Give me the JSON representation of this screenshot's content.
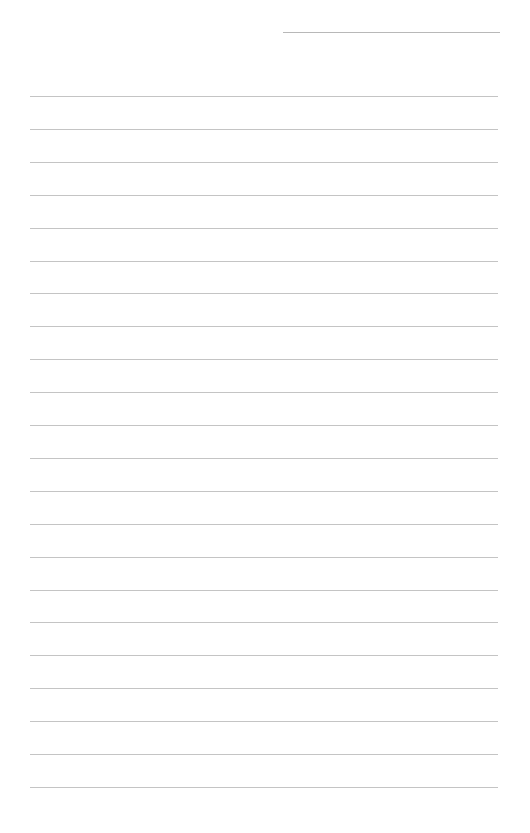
{
  "page": {
    "type": "lined-paper",
    "background": "#ffffff",
    "line_color": "#c4c4c4",
    "header_line": {
      "present": true
    },
    "rule_count": 22
  }
}
